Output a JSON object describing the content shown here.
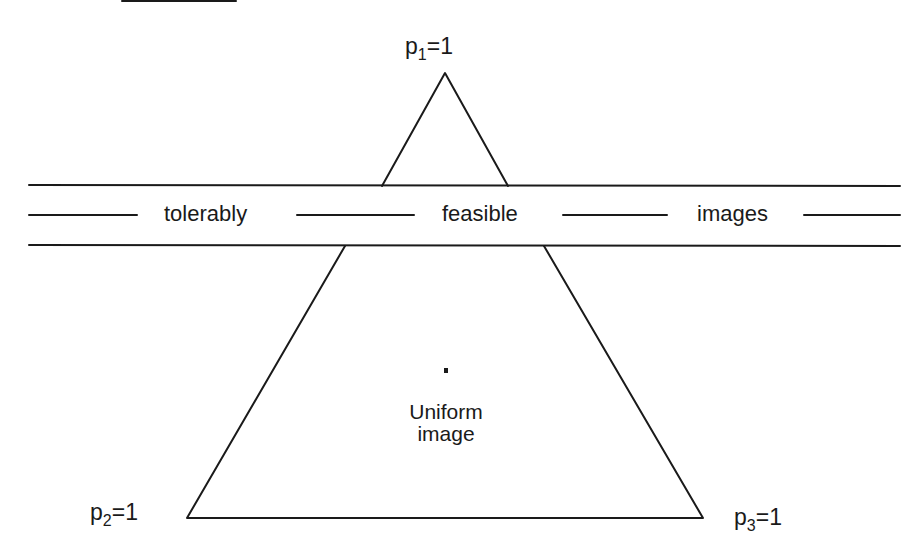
{
  "figure": {
    "type": "simplex-feasibility-diagram",
    "vertices": {
      "top": {
        "label_var": "p",
        "label_sub": "1",
        "label_eq": "=1",
        "x": 445,
        "y": 73
      },
      "bottom_left": {
        "label_var": "p",
        "label_sub": "2",
        "label_eq": "=1",
        "x": 187,
        "y": 518
      },
      "bottom_right": {
        "label_var": "p",
        "label_sub": "3",
        "label_eq": "=1",
        "x": 703,
        "y": 518
      }
    },
    "band": {
      "top_line_y": 185,
      "middle_line_y": 215,
      "bottom_line_y": 245,
      "x_start": 29,
      "x_end": 900,
      "words": [
        "tolerably",
        "feasible",
        "images"
      ],
      "phrase": "tolerably feasible images"
    },
    "center": {
      "label_line1": "Uniform",
      "label_line2": "image",
      "point": {
        "x": 446,
        "y": 370
      }
    },
    "stroke_color": "#1a1a1a",
    "background_color": "#ffffff"
  }
}
